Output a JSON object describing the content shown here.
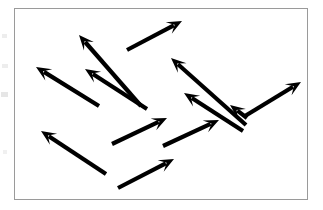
{
  "figure": {
    "canvas": {
      "width": 323,
      "height": 210
    },
    "background_color": "#ffffff",
    "frame": {
      "x": 14,
      "y": 8,
      "width": 294,
      "height": 192,
      "border_color": "#9a9a9a",
      "border_width": 1,
      "fill_color": "#ffffff"
    },
    "arrow_style": {
      "color": "#000000",
      "shaft_width": 4.2,
      "head_length": 15,
      "head_half_width": 6.5,
      "count": 12
    },
    "arrows": [
      {
        "id": "arrow-1",
        "direction": "up-left",
        "tail_x": 141,
        "tail_y": 106,
        "tip_x": 79,
        "tip_y": 35,
        "angle_deg": 131
      },
      {
        "id": "arrow-2",
        "direction": "up-left",
        "tail_x": 147,
        "tail_y": 109,
        "tip_x": 85,
        "tip_y": 69,
        "angle_deg": 147
      },
      {
        "id": "arrow-3",
        "direction": "up-left",
        "tail_x": 99,
        "tail_y": 106,
        "tip_x": 36,
        "tip_y": 67,
        "angle_deg": 148
      },
      {
        "id": "arrow-4",
        "direction": "up-right",
        "tail_x": 127,
        "tail_y": 50,
        "tip_x": 182,
        "tip_y": 21,
        "angle_deg": 28
      },
      {
        "id": "arrow-5",
        "direction": "up-left",
        "tail_x": 246,
        "tail_y": 125,
        "tip_x": 171,
        "tip_y": 58,
        "angle_deg": 138
      },
      {
        "id": "arrow-6",
        "direction": "up-left",
        "tail_x": 243,
        "tail_y": 131,
        "tip_x": 184,
        "tip_y": 93,
        "angle_deg": 147
      },
      {
        "id": "arrow-7",
        "direction": "up-right",
        "tail_x": 245,
        "tail_y": 116,
        "tip_x": 301,
        "tip_y": 82,
        "angle_deg": 31
      },
      {
        "id": "arrow-8",
        "direction": "up-left",
        "tail_x": 106,
        "tail_y": 174,
        "tip_x": 41,
        "tip_y": 131,
        "angle_deg": 146
      },
      {
        "id": "arrow-9",
        "direction": "up-right",
        "tail_x": 112,
        "tail_y": 144,
        "tip_x": 167,
        "tip_y": 118,
        "angle_deg": 25
      },
      {
        "id": "arrow-10",
        "direction": "up-right",
        "tail_x": 163,
        "tail_y": 146,
        "tip_x": 219,
        "tip_y": 120,
        "angle_deg": 25
      },
      {
        "id": "arrow-11",
        "direction": "up-right",
        "tail_x": 118,
        "tail_y": 188,
        "tip_x": 174,
        "tip_y": 159,
        "angle_deg": 27
      },
      {
        "id": "arrow-12",
        "direction": "up-left",
        "tail_x": 247,
        "tail_y": 118,
        "tip_x": 230,
        "tip_y": 105,
        "angle_deg": 143
      }
    ],
    "page_artifacts": [
      {
        "id": "artifact-1",
        "x": 2,
        "y": 34,
        "width": 5,
        "height": 4,
        "color": "#ededed"
      },
      {
        "id": "artifact-2",
        "x": 2,
        "y": 64,
        "width": 6,
        "height": 4,
        "color": "#ededed"
      },
      {
        "id": "artifact-3",
        "x": 1,
        "y": 92,
        "width": 7,
        "height": 5,
        "color": "#e6e6e6"
      },
      {
        "id": "artifact-4",
        "x": 3,
        "y": 150,
        "width": 4,
        "height": 4,
        "color": "#f0f0f0"
      }
    ]
  }
}
